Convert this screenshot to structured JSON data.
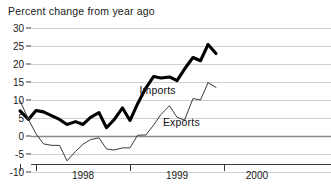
{
  "chart_data": {
    "type": "line",
    "title": "Percent change from year ago",
    "xlabel": "",
    "ylabel": "",
    "ylim": [
      -10,
      30
    ],
    "xlim": [
      1997.83,
      1999.83
    ],
    "grid": true,
    "legend": "inline-annotation",
    "y_ticks": [
      30,
      25,
      20,
      15,
      10,
      5,
      0,
      -5,
      -10
    ],
    "y_tick_labels": [
      "30",
      "25",
      "20",
      "15",
      "10",
      "5",
      "0",
      "-5",
      "-10"
    ],
    "x_ticks": [
      1997.83,
      1998.0,
      1999.0,
      2000.0
    ],
    "x_tick_labels": [
      "1998",
      "1999",
      "2000"
    ],
    "x_tick_label_positions": [
      1998.5,
      1999.5,
      2000.35
    ],
    "zero_line": 0,
    "series": [
      {
        "name": "Imports",
        "label": "Imports",
        "color": "#000000",
        "line_width": 3.1,
        "label_x": 1999.1,
        "label_y": 12.6,
        "x": [
          1997.83,
          1997.92,
          1998.0,
          1998.08,
          1998.17,
          1998.25,
          1998.33,
          1998.42,
          1998.5,
          1998.58,
          1998.67,
          1998.75,
          1998.83,
          1998.92,
          1999.0,
          1999.08,
          1999.17,
          1999.25,
          1999.33,
          1999.42,
          1999.5,
          1999.58,
          1999.67,
          1999.75,
          1999.83
        ],
        "values": [
          7.0,
          4.6,
          7.1,
          6.7,
          5.6,
          4.6,
          3.2,
          4.0,
          3.2,
          5.2,
          6.5,
          2.3,
          4.5,
          7.8,
          4.3,
          8.9,
          13.4,
          16.5,
          16.1,
          16.4,
          15.4,
          18.6,
          21.8,
          20.9,
          25.4
        ]
      },
      {
        "name": "Exports",
        "label": "Exports",
        "color": "#3a3a3a",
        "line_width": 1.0,
        "label_x": 1999.35,
        "label_y": 3.6,
        "x": [
          1997.83,
          1997.92,
          1998.0,
          1998.08,
          1998.17,
          1998.25,
          1998.33,
          1998.42,
          1998.5,
          1998.58,
          1998.67,
          1998.75,
          1998.83,
          1998.92,
          1999.0,
          1999.08,
          1999.17,
          1999.25,
          1999.33,
          1999.42,
          1999.5,
          1999.58,
          1999.67,
          1999.75,
          1999.83
        ],
        "values": [
          9.8,
          4.6,
          0.6,
          -2.2,
          -2.6,
          -2.6,
          -6.9,
          -4.3,
          -2.3,
          -1.0,
          -0.5,
          -3.6,
          -3.9,
          -3.3,
          -3.3,
          0.2,
          0.3,
          3.0,
          6.0,
          8.4,
          5.2,
          4.4,
          10.4,
          10.0,
          14.8
        ]
      }
    ],
    "series_end_notes": [
      {
        "series": "Imports",
        "final_value": 22.9
      },
      {
        "series": "Exports",
        "final_value": 13.5
      }
    ]
  }
}
